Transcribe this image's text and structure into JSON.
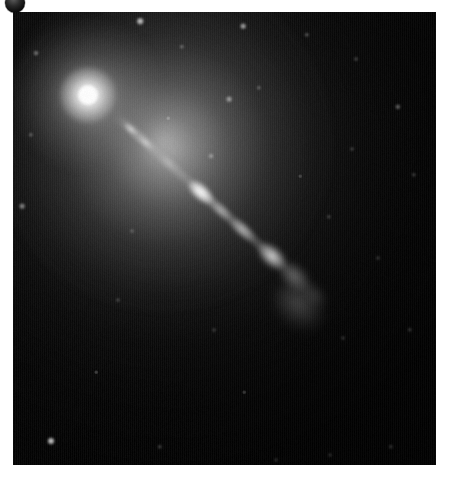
{
  "page": {
    "width": 451,
    "height": 481,
    "background_color": "#ffffff",
    "caption": ""
  },
  "badge": {
    "name": "corner-circle-badge",
    "shape": "circle",
    "color": "#2a2a2a",
    "x": 5,
    "y": -7,
    "diameter": 20,
    "label": ""
  },
  "image": {
    "title": "",
    "alt_text": "",
    "frame": {
      "x": 13,
      "y": 12,
      "width": 423,
      "height": 453
    },
    "background_color": "#000000",
    "subject": "elliptical galaxy nucleus with relativistic jet",
    "nucleus": {
      "name": "galaxy-core",
      "x": 88,
      "y": 95,
      "peak_color": "#ffffff",
      "halo_color": "#9a9a9a"
    },
    "jet": {
      "name": "relativistic-jet",
      "origin_x": 88,
      "origin_y": 95,
      "angle_degrees": 42,
      "length": 300,
      "color": "#e6e6e6",
      "knots": [
        {
          "label": "",
          "x": 122,
          "y": 126,
          "brightness": 0.7
        },
        {
          "label": "",
          "x": 137,
          "y": 139,
          "brightness": 0.55
        },
        {
          "label": "",
          "x": 159,
          "y": 159,
          "brightness": 0.42
        },
        {
          "label": "",
          "x": 192,
          "y": 189,
          "brightness": 1.0
        },
        {
          "label": "",
          "x": 213,
          "y": 208,
          "brightness": 0.55
        },
        {
          "label": "",
          "x": 234,
          "y": 227,
          "brightness": 0.7
        },
        {
          "label": "",
          "x": 264,
          "y": 254,
          "brightness": 0.95
        },
        {
          "label": "",
          "x": 286,
          "y": 274,
          "brightness": 0.5
        },
        {
          "label": "",
          "x": 306,
          "y": 292,
          "brightness": 0.28
        }
      ]
    },
    "stars": [
      {
        "x": 140,
        "y": 21,
        "size": 3.0,
        "brightness": 0.8
      },
      {
        "x": 243,
        "y": 26,
        "size": 2.6,
        "brightness": 0.65
      },
      {
        "x": 182,
        "y": 47,
        "size": 2.0,
        "brightness": 0.4
      },
      {
        "x": 307,
        "y": 35,
        "size": 2.0,
        "brightness": 0.42
      },
      {
        "x": 36,
        "y": 53,
        "size": 2.2,
        "brightness": 0.45
      },
      {
        "x": 356,
        "y": 59,
        "size": 1.8,
        "brightness": 0.35
      },
      {
        "x": 229,
        "y": 99,
        "size": 2.6,
        "brightness": 0.55
      },
      {
        "x": 259,
        "y": 88,
        "size": 2.0,
        "brightness": 0.38
      },
      {
        "x": 398,
        "y": 107,
        "size": 2.4,
        "brightness": 0.5
      },
      {
        "x": 31,
        "y": 135,
        "size": 2.0,
        "brightness": 0.38
      },
      {
        "x": 211,
        "y": 156,
        "size": 2.2,
        "brightness": 0.42
      },
      {
        "x": 352,
        "y": 149,
        "size": 1.8,
        "brightness": 0.32
      },
      {
        "x": 414,
        "y": 175,
        "size": 2.0,
        "brightness": 0.36
      },
      {
        "x": 22,
        "y": 206,
        "size": 2.6,
        "brightness": 0.52
      },
      {
        "x": 132,
        "y": 231,
        "size": 1.8,
        "brightness": 0.3
      },
      {
        "x": 329,
        "y": 217,
        "size": 2.0,
        "brightness": 0.34
      },
      {
        "x": 378,
        "y": 258,
        "size": 1.8,
        "brightness": 0.3
      },
      {
        "x": 118,
        "y": 300,
        "size": 1.8,
        "brightness": 0.28
      },
      {
        "x": 214,
        "y": 330,
        "size": 1.8,
        "brightness": 0.28
      },
      {
        "x": 343,
        "y": 338,
        "size": 1.8,
        "brightness": 0.28
      },
      {
        "x": 410,
        "y": 330,
        "size": 2.0,
        "brightness": 0.34
      },
      {
        "x": 51,
        "y": 441,
        "size": 3.2,
        "brightness": 0.85
      },
      {
        "x": 160,
        "y": 447,
        "size": 2.0,
        "brightness": 0.34
      },
      {
        "x": 276,
        "y": 460,
        "size": 1.8,
        "brightness": 0.26
      },
      {
        "x": 330,
        "y": 455,
        "size": 1.8,
        "brightness": 0.26
      },
      {
        "x": 391,
        "y": 447,
        "size": 2.0,
        "brightness": 0.32
      },
      {
        "x": 244,
        "y": 392,
        "size": 1.6,
        "brightness": 0.24
      },
      {
        "x": 96,
        "y": 372,
        "size": 1.6,
        "brightness": 0.24
      },
      {
        "x": 300,
        "y": 176,
        "size": 1.6,
        "brightness": 0.24
      },
      {
        "x": 168,
        "y": 118,
        "size": 1.6,
        "brightness": 0.26
      }
    ]
  }
}
